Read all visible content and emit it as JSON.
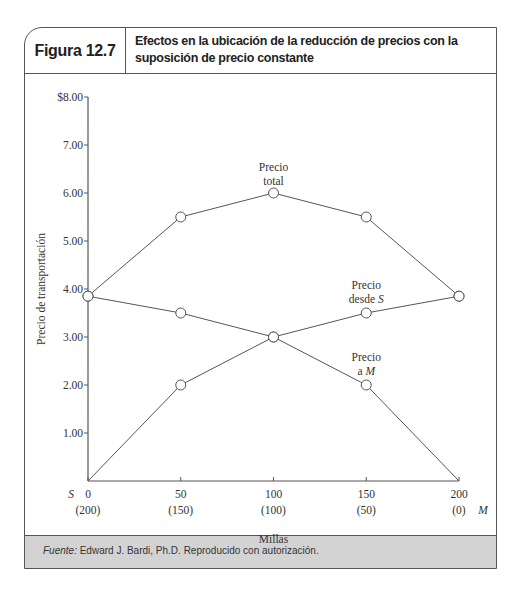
{
  "figure": {
    "number": "Figura 12.7",
    "title": "Efectos en la ubicación de la reducción de precios con la suposición de precio constante",
    "source_label": "Fuente:",
    "source_text": " Edward J. Bardi, Ph.D. Reproducido con autorización."
  },
  "chart_data": {
    "type": "line",
    "title": "Efectos en la ubicación de la reducción de precios con la suposición de precio constante",
    "xlabel": "Millas",
    "ylabel": "Precio de transportación",
    "x": [
      0,
      50,
      100,
      150,
      200
    ],
    "x_tick_labels": [
      "0",
      "50",
      "100",
      "150",
      "200"
    ],
    "x_tick_sublabels": [
      "(200)",
      "(150)",
      "(100)",
      "(50)",
      "(0)"
    ],
    "x_endpoint_labels": {
      "left": "S",
      "right": "M"
    },
    "xlim": [
      0,
      200
    ],
    "ylim": [
      0,
      8
    ],
    "y_ticks": [
      1,
      2,
      3,
      4,
      5,
      6,
      7,
      8
    ],
    "y_tick_labels": [
      "1.00",
      "2.00",
      "3.00",
      "4.00",
      "5.00",
      "6.00",
      "7.00",
      "$8.00"
    ],
    "grid": false,
    "series": [
      {
        "name": "Precio total",
        "label_lines": [
          "Precio",
          "total"
        ],
        "values": [
          3.85,
          5.5,
          6.0,
          5.5,
          3.85
        ]
      },
      {
        "name": "Precio desde S",
        "label_lines": [
          "Precio",
          "desde S"
        ],
        "values": [
          0,
          2.0,
          3.0,
          3.5,
          3.85
        ]
      },
      {
        "name": "Precio a M",
        "label_lines": [
          "Precio",
          "a M"
        ],
        "values": [
          3.85,
          3.5,
          3.0,
          2.0,
          0
        ]
      }
    ],
    "marker": "open-circle"
  }
}
